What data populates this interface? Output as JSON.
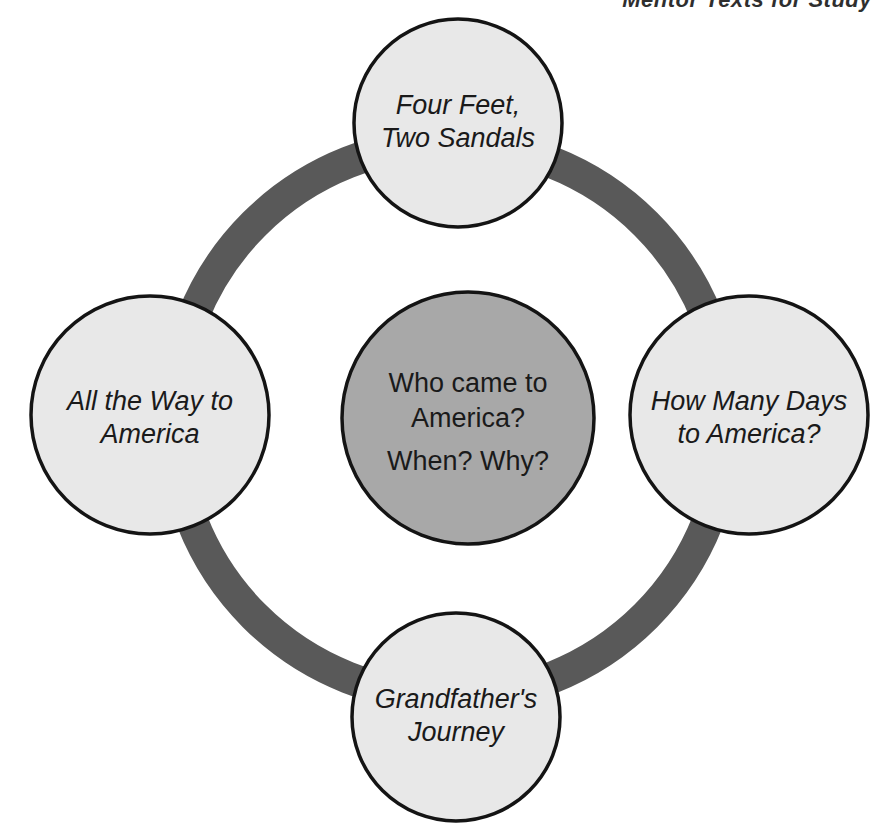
{
  "page": {
    "background_color": "#ffffff",
    "width": 882,
    "height": 830,
    "clipped_header_fragment": "Mentor Texts for Study"
  },
  "colors": {
    "ring": "#595959",
    "satellite_fill": "#e8e8e8",
    "center_fill": "#a8a8a8",
    "outline": "#141414",
    "text": "#1a1a1a"
  },
  "diagram": {
    "type": "concept-web",
    "center": {
      "name": "center-node",
      "lines": [
        "Who came to",
        "America?",
        "When?  Why?"
      ],
      "line1": "Who came to",
      "line2": "America?",
      "line3": "When?  Why?",
      "fill": "#a8a8a8"
    },
    "nodes": [
      {
        "position": "top",
        "name": "node-top",
        "lines": [
          "Four Feet,",
          "Two Sandals"
        ],
        "line1": "Four Feet,",
        "line2": "Two Sandals",
        "italic": true
      },
      {
        "position": "right",
        "name": "node-right",
        "lines": [
          "How Many Days",
          "to America?"
        ],
        "line1": "How Many Days",
        "line2": "to America?",
        "italic": true
      },
      {
        "position": "bottom",
        "name": "node-bottom",
        "lines": [
          "Grandfather's",
          "Journey"
        ],
        "line1": "Grandfather's",
        "line2": "Journey",
        "italic": true
      },
      {
        "position": "left",
        "name": "node-left",
        "lines": [
          "All the Way to",
          "America"
        ],
        "line1": "All the Way to",
        "line2": "America",
        "italic": true
      }
    ]
  }
}
